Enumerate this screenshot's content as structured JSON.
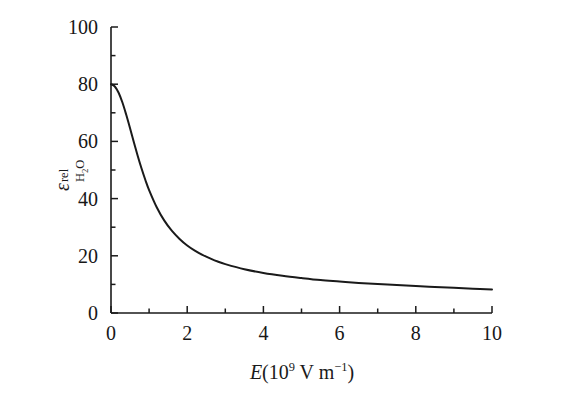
{
  "figure": {
    "background_color": "#ffffff",
    "line_color": "#1a1a1a",
    "axis_color": "#1a1a1a"
  },
  "axes": {
    "x": {
      "title_variable": "E",
      "title_units_prefix": "(10",
      "title_units_exp": "9",
      "title_units_mid": " V m",
      "title_units_exp2": "−1",
      "title_units_suffix": ")",
      "title_full": "E (10⁹ V m⁻¹)",
      "min": 0,
      "max": 10,
      "major_ticks": [
        0,
        2,
        4,
        6,
        8,
        10
      ],
      "minor_ticks": [
        1,
        3,
        5,
        7,
        9
      ],
      "tick_labels": [
        "0",
        "2",
        "4",
        "6",
        "8",
        "10"
      ],
      "tick_direction": "in"
    },
    "y": {
      "title_symbol": "ε",
      "title_superscript": "rel",
      "title_subscript": "H",
      "title_subscript_num": "2",
      "title_subscript_tail": "O",
      "title_full": "ε_H2O^rel",
      "min": 0,
      "max": 100,
      "major_ticks": [
        0,
        20,
        40,
        60,
        80,
        100
      ],
      "minor_ticks": [
        10,
        30,
        50,
        70,
        90
      ],
      "tick_labels": [
        "0",
        "20",
        "40",
        "60",
        "80",
        "100"
      ],
      "tick_direction": "in"
    },
    "spines": {
      "left": true,
      "bottom": true,
      "top": false,
      "right": false
    },
    "grid": false,
    "legend": false
  },
  "chart_data": {
    "type": "line",
    "title": "",
    "xlabel": "E (10⁹ V m⁻¹)",
    "ylabel": "εrel H2O",
    "xlim": [
      0,
      10
    ],
    "ylim": [
      0,
      100
    ],
    "grid": false,
    "legend": null,
    "series": [
      {
        "name": "relative permittivity of water vs field",
        "x": [
          0,
          0.1,
          0.2,
          0.3,
          0.4,
          0.5,
          0.6,
          0.7,
          0.8,
          0.9,
          1.0,
          1.2,
          1.4,
          1.6,
          1.8,
          2.0,
          2.2,
          2.4,
          2.6,
          2.8,
          3.0,
          3.5,
          4.0,
          4.5,
          5.0,
          5.5,
          6.0,
          6.5,
          7.0,
          7.5,
          8.0,
          8.5,
          9.0,
          9.5,
          10.0
        ],
        "y": [
          80.0,
          79.2,
          77.0,
          73.6,
          69.3,
          64.6,
          59.7,
          55.0,
          50.6,
          46.6,
          43.0,
          37.0,
          32.3,
          28.7,
          25.9,
          23.6,
          21.8,
          20.3,
          19.1,
          18.0,
          17.1,
          15.3,
          14.0,
          13.0,
          12.2,
          11.5,
          11.0,
          10.5,
          10.1,
          9.8,
          9.4,
          9.1,
          8.8,
          8.5,
          8.2
        ]
      }
    ]
  }
}
